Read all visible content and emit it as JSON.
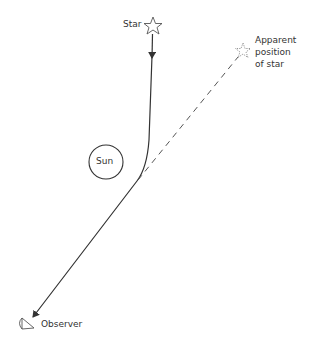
{
  "diagram": {
    "labels": {
      "star": "Star",
      "apparent_line1": "Apparent",
      "apparent_line2": "position",
      "apparent_line3": "of star",
      "sun": "Sun",
      "observer": "Observer"
    },
    "icons": [
      "star-icon",
      "apparent-star-icon",
      "observer-eye-icon"
    ],
    "colors": {
      "line": "#333333",
      "dashed": "#555555",
      "background": "#ffffff"
    }
  }
}
